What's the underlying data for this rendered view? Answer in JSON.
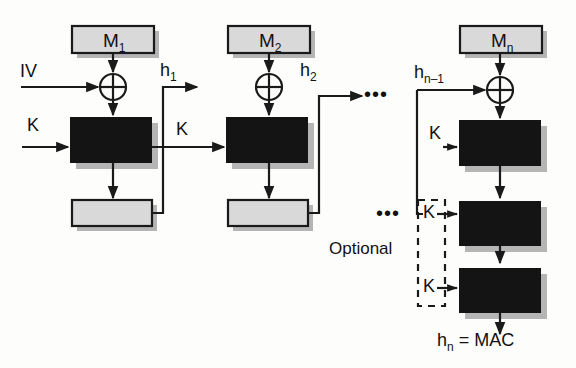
{
  "diagram": {
    "colors": {
      "message_box_fill": "#d9d9d9",
      "message_box_stroke": "#1a1a1a",
      "cipher_box_fill": "#141414",
      "output_box_fill": "#d9d9d9",
      "shadow": "#b5b5b5",
      "line": "#1a1a1a",
      "background": "#fdfdfb"
    },
    "message_blocks": [
      {
        "name": "m1",
        "label": "M",
        "sub": "1"
      },
      {
        "name": "m2",
        "label": "M",
        "sub": "2"
      },
      {
        "name": "mn",
        "label": "M",
        "sub": "n"
      }
    ],
    "chain_labels": [
      {
        "name": "iv",
        "label": "IV",
        "sub": ""
      },
      {
        "name": "h1",
        "label": "h",
        "sub": "1"
      },
      {
        "name": "h2",
        "label": "h",
        "sub": "2"
      },
      {
        "name": "hn1",
        "label": "h",
        "sub": "n–1"
      }
    ],
    "key_labels": [
      {
        "name": "k-stage-1",
        "label": "K"
      },
      {
        "name": "k-stage-2",
        "label": "K"
      },
      {
        "name": "k-stage-n",
        "label": "K"
      },
      {
        "name": "k-optional-1",
        "label": "K"
      },
      {
        "name": "k-optional-2",
        "label": "K"
      }
    ],
    "optional_label": "Optional",
    "ellipsis": "•••",
    "output_label": {
      "label": "h",
      "sub": "n",
      "tail": " = MAC"
    }
  }
}
